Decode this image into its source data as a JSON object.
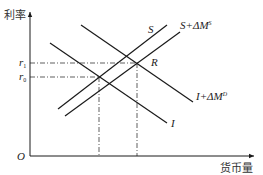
{
  "diagram": {
    "y_axis": {
      "label": "利率"
    },
    "x_axis": {
      "label": "货币量"
    },
    "origin": "O",
    "levels": [
      {
        "name": "r",
        "sub": "1",
        "y": 63
      },
      {
        "name": "r",
        "sub": "0",
        "y": 77
      }
    ],
    "curves": {
      "S": {
        "label": "S",
        "x1": 58,
        "y1": 109,
        "x2": 167,
        "y2": 25
      },
      "S_shifted": {
        "label_main": "S+ΔM",
        "label_sup": "S",
        "x1": 65,
        "y1": 116,
        "x2": 180,
        "y2": 32
      },
      "I": {
        "label": "I",
        "x1": 50,
        "y1": 43,
        "x2": 167,
        "y2": 123
      },
      "I_shifted": {
        "label_main": "I+ΔM",
        "label_sup": "D",
        "x1": 81,
        "y1": 25,
        "x2": 193,
        "y2": 102
      }
    },
    "points": {
      "R": {
        "label": "R"
      }
    },
    "colors": {
      "line": "#1a1a1a",
      "text": "#333333",
      "background": "#ffffff"
    }
  }
}
